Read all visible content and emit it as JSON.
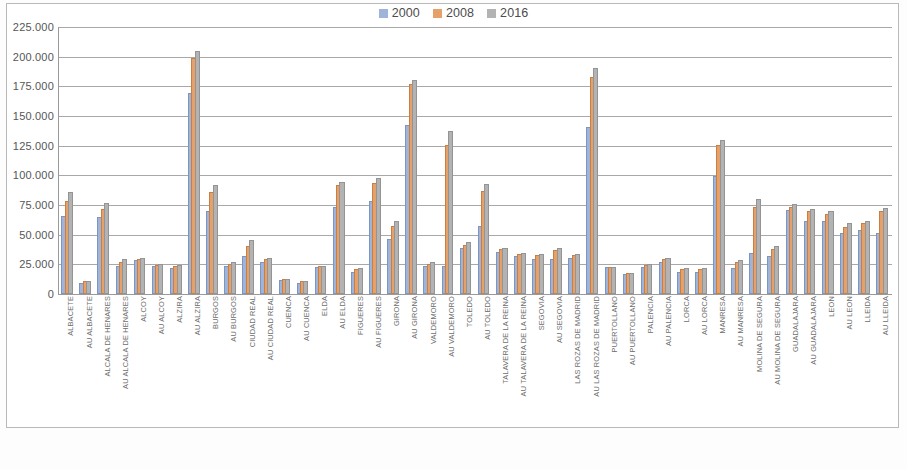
{
  "legend": {
    "position": "top-center",
    "entries": [
      {
        "label": "2000",
        "color": "#9fb4d8"
      },
      {
        "label": "2008",
        "color": "#e5a169"
      },
      {
        "label": "2016",
        "color": "#b3b3b3"
      }
    ]
  },
  "y_axis": {
    "tick_labels": [
      "225.000",
      "200.000",
      "175.000",
      "150.000",
      "125.000",
      "100.000",
      "75.000",
      "50.000",
      "25.000",
      "0"
    ]
  },
  "chart_data": {
    "type": "bar",
    "title": "",
    "subtitle": "",
    "xlabel": "",
    "ylabel": "",
    "ylim": [
      0,
      225000
    ],
    "ytick_values": [
      0,
      25000,
      50000,
      75000,
      100000,
      125000,
      150000,
      175000,
      200000,
      225000
    ],
    "grid": true,
    "legend_position": "top-center",
    "number_format": "european-thousands-dot",
    "categories": [
      "ALBACETE",
      "AU ALBACETE",
      "ALCALA DE HENARES",
      "AU ALCALA DE HENARES",
      "ALCOY",
      "AU ALCOY",
      "ALZIRA",
      "AU ALZIRA",
      "BURGOS",
      "AU BURGOS",
      "CIUDAD REAL",
      "AU CIUDAD REAL",
      "CUENCA",
      "AU CUENCA",
      "ELDA",
      "AU ELDA",
      "FIGUERES",
      "AU FIGUERES",
      "GIRONA",
      "AU GIRONA",
      "VALDEMORO",
      "AU VALDEMORO",
      "TOLEDO",
      "AU TOLEDO",
      "TALAVERA DE LA REINA",
      "AU TALAVERA DE LA REINA",
      "SEGOVIA",
      "AU SEGOVIA",
      "LAS ROZAS DE MADRID",
      "AU LAS ROZAS DE MADRID",
      "PUERTOLLANO",
      "AU PUERTOLLANO",
      "PALENCIA",
      "AU PALENCIA",
      "LORCA",
      "AU LORCA",
      "MANRESA",
      "AU MANRESA",
      "MOLINA DE SEGURA",
      "AU MOLINA DE SEGURA",
      "GUADALAJARA",
      "AU GUADALAJARA",
      "LEON",
      "AU LEON",
      "LLEIDA",
      "AU LLEIDA"
    ],
    "series": [
      {
        "name": "2000",
        "color": "#9fb4d8",
        "values": [
          64000,
          8000,
          63000,
          22000,
          27000,
          22000,
          20000,
          168000,
          68000,
          22000,
          30000,
          25000,
          10000,
          8000,
          21000,
          72000,
          17000,
          77000,
          45000,
          141000,
          22000,
          22000,
          37000,
          56000,
          34000,
          30000,
          28000,
          28000,
          29000,
          139000,
          21000,
          15000,
          21000,
          25000,
          17000,
          17000,
          98000,
          20000,
          33000,
          30000,
          69000,
          60000,
          60000,
          50000,
          52000,
          50000
        ]
      },
      {
        "name": "2008",
        "color": "#e5a169",
        "values": [
          77000,
          9000,
          70000,
          25000,
          28000,
          23000,
          22000,
          197000,
          84000,
          24000,
          39000,
          28000,
          11000,
          9000,
          22000,
          90000,
          19000,
          92000,
          56000,
          175000,
          24000,
          124000,
          40000,
          85000,
          36000,
          32000,
          31000,
          35000,
          31000,
          181000,
          21000,
          16000,
          23000,
          28000,
          19000,
          19000,
          124000,
          25000,
          72000,
          36000,
          72000,
          68000,
          66000,
          55000,
          58000,
          68000
        ]
      },
      {
        "name": "2016",
        "color": "#b3b3b3",
        "values": [
          84000,
          9000,
          75000,
          28000,
          29000,
          24000,
          23000,
          203000,
          90000,
          25000,
          44000,
          29000,
          11000,
          9000,
          22000,
          93000,
          20000,
          96000,
          60000,
          179000,
          25000,
          136000,
          42000,
          91000,
          37000,
          33000,
          32000,
          37000,
          32000,
          189000,
          21000,
          16000,
          24000,
          29000,
          20000,
          20000,
          128000,
          27000,
          78000,
          39000,
          74000,
          70000,
          68000,
          58000,
          60000,
          71000
        ]
      }
    ]
  }
}
